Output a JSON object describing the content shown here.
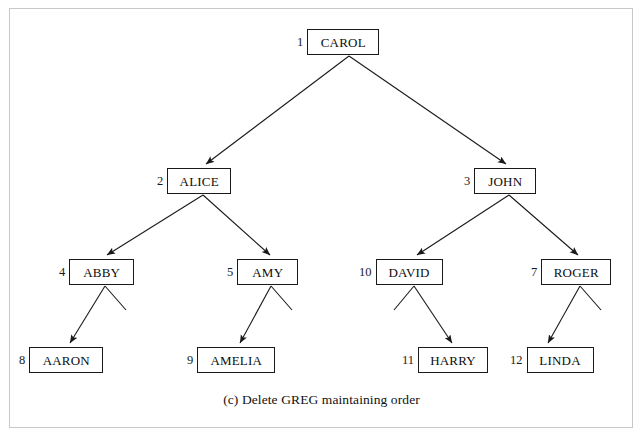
{
  "figure": {
    "caption": "(c) Delete GREG maintaining order",
    "border_color": "#c8c8c8",
    "line_color": "#1a1a1a",
    "background": "#ffffff"
  },
  "tree": {
    "type": "binary-tree",
    "root": "CAROL",
    "nodes": [
      {
        "id": "carol",
        "index": "1",
        "label": "CAROL",
        "level": 0,
        "x": 311,
        "y": 29,
        "box_x": 313,
        "box_w": 72
      },
      {
        "id": "alice",
        "index": "2",
        "label": "ALICE",
        "level": 1,
        "x": 158,
        "y": 168,
        "box_x": 171,
        "box_w": 64
      },
      {
        "id": "john",
        "index": "3",
        "label": "JOHN",
        "level": 1,
        "x": 465,
        "y": 168,
        "box_x": 478,
        "box_w": 62
      },
      {
        "id": "abby",
        "index": "4",
        "label": "ABBY",
        "level": 2,
        "x": 60,
        "y": 259,
        "box_x": 73,
        "box_w": 65
      },
      {
        "id": "amy",
        "index": "5",
        "label": "AMY",
        "level": 2,
        "x": 228,
        "y": 259,
        "box_x": 241,
        "box_w": 61
      },
      {
        "id": "david",
        "index": "10",
        "label": "DAVID",
        "level": 2,
        "x": 360,
        "y": 259,
        "box_x": 381,
        "box_w": 67
      },
      {
        "id": "roger",
        "index": "7",
        "label": "ROGER",
        "level": 2,
        "x": 532,
        "y": 259,
        "box_x": 546,
        "box_w": 70
      },
      {
        "id": "aaron",
        "index": "8",
        "label": "AARON",
        "level": 3,
        "x": 20,
        "y": 347,
        "box_x": 33,
        "box_w": 74
      },
      {
        "id": "amelia",
        "index": "9",
        "label": "AMELIA",
        "level": 3,
        "x": 188,
        "y": 347,
        "box_x": 201,
        "box_w": 78
      },
      {
        "id": "harry",
        "index": "11",
        "label": "HARRY",
        "level": 3,
        "x": 403,
        "y": 347,
        "box_x": 424,
        "box_w": 70
      },
      {
        "id": "linda",
        "index": "12",
        "label": "LINDA",
        "level": 3,
        "x": 511,
        "y": 347,
        "box_x": 532,
        "box_w": 67
      }
    ],
    "edges": [
      {
        "from": "carol",
        "to": "alice",
        "kind": "arrow",
        "side": "left"
      },
      {
        "from": "carol",
        "to": "john",
        "kind": "arrow",
        "side": "right"
      },
      {
        "from": "alice",
        "to": "abby",
        "kind": "arrow",
        "side": "left"
      },
      {
        "from": "alice",
        "to": "amy",
        "kind": "arrow",
        "side": "right"
      },
      {
        "from": "john",
        "to": "david",
        "kind": "arrow",
        "side": "left"
      },
      {
        "from": "john",
        "to": "roger",
        "kind": "arrow",
        "side": "right"
      },
      {
        "from": "abby",
        "to": "aaron",
        "kind": "arrow",
        "side": "left"
      },
      {
        "from": "abby",
        "to": null,
        "kind": "stub",
        "side": "right"
      },
      {
        "from": "amy",
        "to": "amelia",
        "kind": "arrow",
        "side": "left"
      },
      {
        "from": "amy",
        "to": null,
        "kind": "stub",
        "side": "right"
      },
      {
        "from": "david",
        "to": null,
        "kind": "stub",
        "side": "left"
      },
      {
        "from": "david",
        "to": "harry",
        "kind": "arrow",
        "side": "right"
      },
      {
        "from": "roger",
        "to": "linda",
        "kind": "arrow",
        "side": "left"
      },
      {
        "from": "roger",
        "to": null,
        "kind": "stub",
        "side": "right"
      }
    ]
  }
}
